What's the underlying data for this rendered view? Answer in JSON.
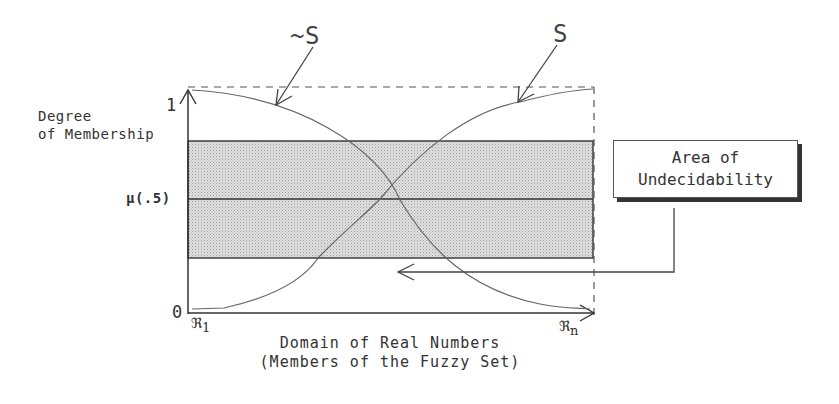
{
  "diagram": {
    "labels": {
      "not_s": "~S",
      "s": "S",
      "y_axis_line1": "Degree",
      "y_axis_line2": "of Membership",
      "y_tick_top": "1",
      "y_tick_mid": "μ(.5)",
      "y_tick_bottom": "0",
      "x_start": "ℜ",
      "x_start_sub": "1",
      "x_end": "ℜ",
      "x_end_sub": "n",
      "x_axis_line1": "Domain of Real Numbers",
      "x_axis_line2": "(Members of the Fuzzy Set)"
    },
    "callout": {
      "line1": "Area of",
      "line2": "Undecidability"
    },
    "colors": {
      "band_fill": "#d4d4d4",
      "line": "#3a3a3a",
      "curve": "#6a6a6a"
    }
  }
}
